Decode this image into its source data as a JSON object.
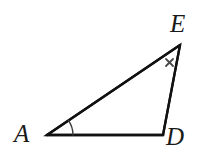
{
  "figure": {
    "name": "triangle-ADE",
    "kind": "geometry-diagram",
    "background_color": "#ffffff",
    "stroke_color": "#111111",
    "stroke_width_px": 2.4,
    "canvas": {
      "width": 201,
      "height": 162
    }
  },
  "vertices": [
    {
      "id": "A",
      "label": "A",
      "x": 47,
      "y": 135
    },
    {
      "id": "D",
      "label": "D",
      "x": 163,
      "y": 135
    },
    {
      "id": "E",
      "label": "E",
      "x": 180,
      "y": 45
    }
  ],
  "sides": [
    {
      "id": "AD",
      "from": "A",
      "to": "D",
      "name": "base-side-AD"
    },
    {
      "id": "DE",
      "from": "D",
      "to": "E",
      "name": "right-side-DE"
    },
    {
      "id": "AE",
      "from": "A",
      "to": "E",
      "name": "hypotenuse-side-AE"
    }
  ],
  "annotations": {
    "angle_arc": {
      "at_vertex": "A",
      "name": "angle-arc-A",
      "radius_px": 26,
      "color": "#3a3a3a",
      "stroke_width_px": 1.4
    },
    "tick_marks": [
      {
        "glyph": "×",
        "on_side": "DE",
        "name": "tick-mark-x-on-DE",
        "x": 170,
        "y": 63,
        "color": "#4a4a4a",
        "size_px": 11
      }
    ]
  },
  "labels": {
    "A": "A",
    "D": "D",
    "E": "E"
  }
}
